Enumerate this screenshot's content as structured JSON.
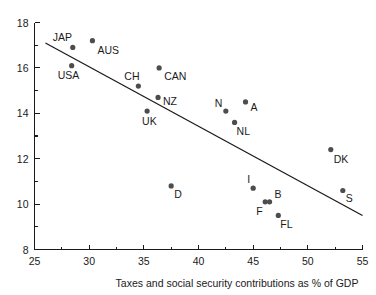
{
  "chart_data": {
    "type": "scatter",
    "title": "",
    "xlabel": "Taxes and social security contributions as % of GDP",
    "ylabel": "",
    "xlim": [
      25,
      55
    ],
    "ylim": [
      8,
      18
    ],
    "grid": false,
    "legend": false,
    "x_ticks": [
      25,
      30,
      35,
      40,
      45,
      50,
      55
    ],
    "x_tick_labels": [
      "25",
      "30",
      "35",
      "40",
      "45",
      "50",
      "55"
    ],
    "x_minor_ticks": [
      27.5,
      32.5,
      37.5,
      42.5,
      47.5,
      52.5
    ],
    "y_ticks": [
      8,
      10,
      12,
      14,
      16,
      18
    ],
    "y_tick_labels": [
      "8",
      "10",
      "12",
      "14",
      "16",
      "18"
    ],
    "y_minor_ticks": [
      9,
      11,
      13,
      15,
      17
    ],
    "marker_color": "#4d4d4d",
    "line_color": "#1a1a1a",
    "points": [
      {
        "label": "JAP",
        "x": 28.5,
        "y": 16.9,
        "label_dx": -20,
        "label_dy": -6
      },
      {
        "label": "USA",
        "x": 28.4,
        "y": 16.1,
        "label_dx": -14,
        "label_dy": 13
      },
      {
        "label": "AUS",
        "x": 30.3,
        "y": 17.2,
        "label_dx": 5,
        "label_dy": 13
      },
      {
        "label": "CH",
        "x": 34.5,
        "y": 15.2,
        "label_dx": -14,
        "label_dy": -6
      },
      {
        "label": "CAN",
        "x": 36.4,
        "y": 16.0,
        "label_dx": 5,
        "label_dy": 12
      },
      {
        "label": "NZ",
        "x": 36.3,
        "y": 14.7,
        "label_dx": 5,
        "label_dy": 8
      },
      {
        "label": "UK",
        "x": 35.3,
        "y": 14.1,
        "label_dx": -5,
        "label_dy": 14
      },
      {
        "label": "D",
        "x": 37.5,
        "y": 10.8,
        "label_dx": 3,
        "label_dy": 12
      },
      {
        "label": "N",
        "x": 42.5,
        "y": 14.1,
        "label_dx": -11,
        "label_dy": -4
      },
      {
        "label": "A",
        "x": 44.3,
        "y": 14.5,
        "label_dx": 5,
        "label_dy": 9
      },
      {
        "label": "NL",
        "x": 43.3,
        "y": 13.6,
        "label_dx": 2,
        "label_dy": 13
      },
      {
        "label": "I",
        "x": 45.0,
        "y": 10.7,
        "label_dx": -6,
        "label_dy": -5
      },
      {
        "label": "F",
        "x": 46.1,
        "y": 10.1,
        "label_dx": -9,
        "label_dy": 13
      },
      {
        "label": "B",
        "x": 46.5,
        "y": 10.1,
        "label_dx": 5,
        "label_dy": -4
      },
      {
        "label": "FL",
        "x": 47.3,
        "y": 9.5,
        "label_dx": 2,
        "label_dy": 13
      },
      {
        "label": "DK",
        "x": 52.1,
        "y": 12.4,
        "label_dx": 3,
        "label_dy": 13
      },
      {
        "label": "S",
        "x": 53.2,
        "y": 10.6,
        "label_dx": 3,
        "label_dy": 12
      }
    ],
    "trend_line": {
      "name": "regression-line",
      "x_start": 26.0,
      "y_start": 17.1,
      "x_end": 55.0,
      "y_end": 9.5
    }
  }
}
